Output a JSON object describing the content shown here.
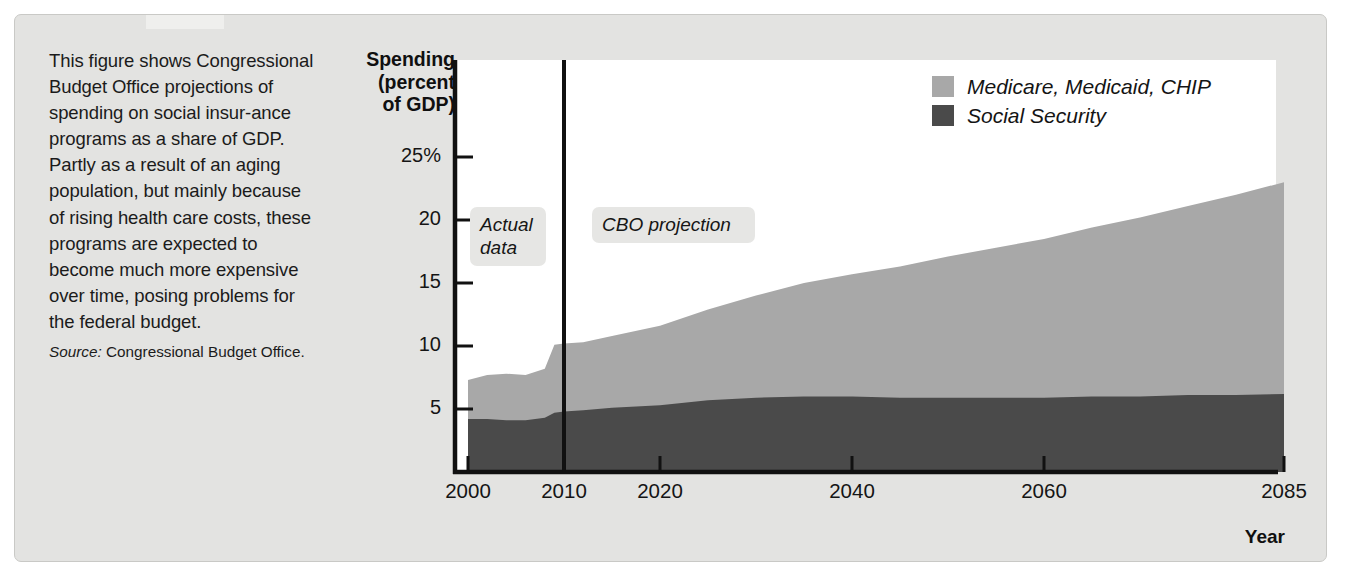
{
  "caption": {
    "body": "This figure shows Congressional Budget Office projections of spending on social insur‐ance programs as a share of GDP. Partly as a result of an aging population, but mainly because of rising health care costs, these programs are expected to become much more expensive over time, posing problems for the federal budget.",
    "source_label": "Source:",
    "source_text": " Congressional Budget Office."
  },
  "legend": {
    "items": [
      {
        "label": "Medicare, Medicaid, CHIP",
        "color": "#a8a8a8"
      },
      {
        "label": "Social Security",
        "color": "#4a4a4a"
      }
    ]
  },
  "annotations": [
    {
      "name": "actual-data",
      "text": "Actual data"
    },
    {
      "name": "cbo-projection",
      "text": "CBO projection"
    }
  ],
  "chart_data": {
    "type": "area",
    "stacked": true,
    "title": "",
    "xlabel": "Year",
    "ylabel": "Spending (percent of GDP)",
    "xlim": [
      2000,
      2085
    ],
    "ylim": [
      0,
      27
    ],
    "grid": false,
    "legend_position": "top-right",
    "xticks": [
      2000,
      2010,
      2020,
      2040,
      2060,
      2085
    ],
    "xticklabels": [
      "2000",
      "2010",
      "2020",
      "2040",
      "2060",
      "2085"
    ],
    "yticks": [
      5,
      10,
      15,
      20,
      25
    ],
    "yticklabels": [
      "5",
      "10",
      "15",
      "20",
      "25%"
    ],
    "divider_year": 2010,
    "divider_label": "boundary between actual data and CBO projection",
    "x": [
      2000,
      2002,
      2004,
      2006,
      2008,
      2009,
      2010,
      2012,
      2015,
      2020,
      2025,
      2030,
      2035,
      2040,
      2045,
      2050,
      2055,
      2060,
      2065,
      2070,
      2075,
      2080,
      2085
    ],
    "series": [
      {
        "name": "Social Security",
        "color": "#4a4a4a",
        "values": [
          4.2,
          4.2,
          4.1,
          4.1,
          4.3,
          4.7,
          4.8,
          4.9,
          5.1,
          5.3,
          5.7,
          5.9,
          6.0,
          6.0,
          5.9,
          5.9,
          5.9,
          5.9,
          6.0,
          6.0,
          6.1,
          6.1,
          6.2
        ]
      },
      {
        "name": "Medicare, Medicaid, CHIP",
        "color": "#a8a8a8",
        "values": [
          3.1,
          3.5,
          3.7,
          3.6,
          3.9,
          5.4,
          5.4,
          5.4,
          5.7,
          6.3,
          7.2,
          8.1,
          9.0,
          9.7,
          10.4,
          11.2,
          11.9,
          12.6,
          13.4,
          14.2,
          15.0,
          15.9,
          16.8
        ]
      }
    ],
    "totals": [
      7.3,
      7.7,
      7.8,
      7.7,
      8.2,
      10.1,
      10.2,
      10.3,
      10.8,
      11.6,
      12.9,
      14.0,
      15.0,
      15.7,
      16.3,
      17.1,
      17.8,
      18.5,
      19.4,
      20.2,
      21.1,
      22.0,
      23.0
    ]
  }
}
